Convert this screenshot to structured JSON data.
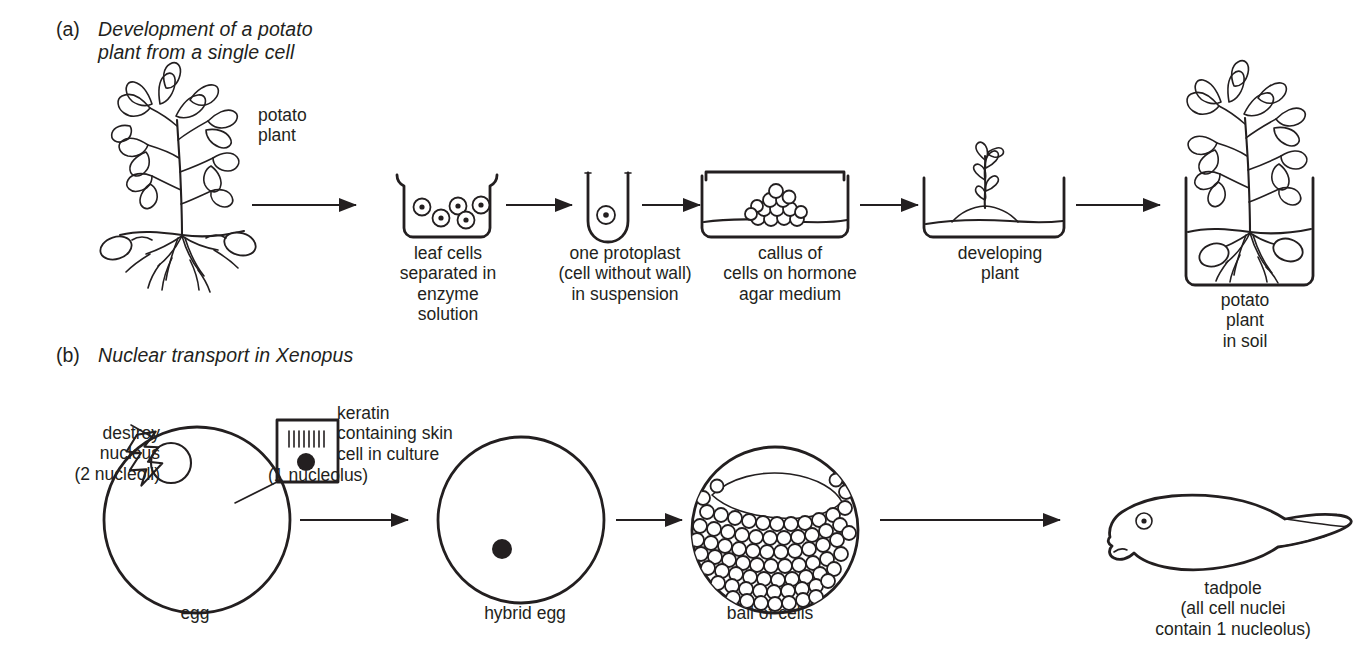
{
  "figure": {
    "background_color": "#ffffff",
    "ink_color": "#231f20"
  },
  "panels": [
    {
      "tag": "(a)",
      "title": "Development of a potato\nplant from a single cell",
      "labels": {
        "source_organism": "potato\nplant",
        "step1": "leaf cells\nseparated in\nenzyme\nsolution",
        "step2": "one protoplast\n(cell without wall)\nin suspension",
        "step3": "callus of\ncells on hormone\nagar medium",
        "step4": "developing\nplant",
        "step5": "potato\nplant\nin soil"
      },
      "arrow_count": 5,
      "stage_count": 6
    },
    {
      "tag": "(b)",
      "title": "Nuclear transport in Xenopus",
      "labels": {
        "destroy_nucleus": "destroy\nnucleus\n(2 nucleoli)",
        "keratin_cell": "keratin\ncontaining skin\ncell in culture",
        "nucleolus_note": "(1 nucleolus)",
        "egg": "egg",
        "hybrid_egg": "hybrid egg",
        "ball_of_cells": "ball of cells",
        "tadpole": "tadpole\n(all cell nuclei\ncontain 1 nucleolus)"
      },
      "arrow_count": 3,
      "stage_count": 4
    }
  ],
  "icons": {
    "potato_plant": "potato-plant-icon",
    "petri_dish": "petri-dish-icon",
    "test_tube": "test-tube-icon",
    "callus_dish": "callus-dish-icon",
    "plantlet_dish": "plantlet-dish-icon",
    "pot_plant": "pot-plant-icon",
    "egg_cell": "egg-cell-icon",
    "keratin_box": "keratin-skin-cell-icon",
    "lightning_bolt": "lightning-bolt-icon",
    "hybrid_egg": "hybrid-egg-icon",
    "blastula": "ball-of-cells-icon",
    "tadpole": "tadpole-icon",
    "arrow": "arrow-right-icon"
  }
}
